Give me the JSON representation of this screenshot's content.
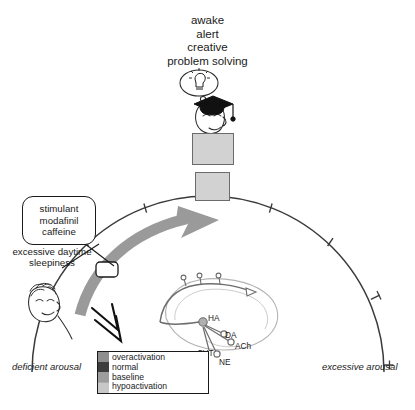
{
  "diagram": {
    "type": "arousal-spectrum-arc"
  },
  "state_text": {
    "lines": [
      "awake",
      "alert",
      "creative",
      "problem solving"
    ]
  },
  "callout": {
    "lines": [
      "stimulant",
      "modafinil",
      "caffeine"
    ],
    "line1": "stimulant",
    "line2": "modafinil",
    "line3": "caffeine"
  },
  "condition": {
    "line1": "excessive daytime",
    "line2": "sleepiness"
  },
  "axis": {
    "left_label": "deficient arousal",
    "right_label": "excessive arousal"
  },
  "legend": {
    "items": [
      {
        "label": "overactivation",
        "color": "#8e8e8e"
      },
      {
        "label": "normal",
        "color": "#3d3d3d"
      },
      {
        "label": "baseline",
        "color": "#9d9d9d"
      },
      {
        "label": "hypoactivation",
        "color": "#c8c8c8"
      }
    ]
  },
  "brain": {
    "neurotransmitters": [
      {
        "abbr": "HA",
        "name": "histamine"
      },
      {
        "abbr": "DA",
        "name": "dopamine"
      },
      {
        "abbr": "ACh",
        "name": "acetylcholine"
      },
      {
        "abbr": "5HT",
        "name": "serotonin"
      },
      {
        "abbr": "NE",
        "name": "norepinephrine"
      }
    ],
    "ha": "HA",
    "da": "DA",
    "ach": "ACh",
    "fivehT": "5HT",
    "ne": "NE"
  },
  "icons": {
    "graduate": "graduate-lightbulb-icon",
    "reading": "person-reading-icon",
    "writing": "person-writing-icon",
    "sleepy_face": "sleepy-face-icon",
    "down_arrow": "double-chevron-down-icon",
    "progress_arrow": "curved-progress-arrow-icon",
    "marker": "position-marker-icon"
  },
  "colors": {
    "arc_stroke": "#3a3a3a",
    "arrow_band": "#9a9a9a",
    "brain_outline": "#9b9b9b",
    "pathway": "#6d6d6d",
    "ink": "#1a1a1a"
  }
}
